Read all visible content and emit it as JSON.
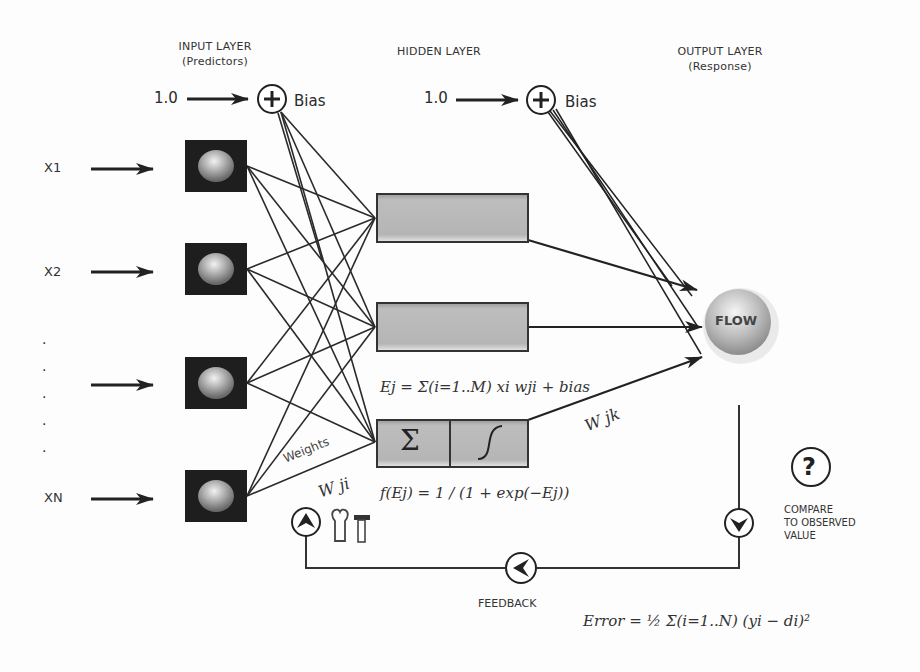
{
  "headers": {
    "input": {
      "title": "INPUT LAYER",
      "subtitle": "(Predictors)"
    },
    "hidden": {
      "title": "HIDDEN LAYER"
    },
    "output": {
      "title": "OUTPUT LAYER",
      "subtitle": "(Response)"
    }
  },
  "bias": [
    {
      "value": "1.0",
      "label": "Bias",
      "icon": "plus-circle-icon"
    },
    {
      "value": "1.0",
      "label": "Bias",
      "icon": "plus-circle-icon"
    }
  ],
  "inputs": [
    {
      "label": "X1"
    },
    {
      "label": "X2"
    },
    {
      "label": ""
    },
    {
      "label": "XN"
    }
  ],
  "ellipsis_dots": [
    "·",
    "·",
    "·",
    "·",
    "·"
  ],
  "hidden_nodes": [
    {
      "type": "neuron"
    },
    {
      "type": "neuron"
    },
    {
      "type": "neuron-detail",
      "sum_symbol": "Σ",
      "activation_icon": "sigmoid-curve-icon"
    }
  ],
  "output_node": {
    "label": "FLOW"
  },
  "weights": {
    "label": "Weights",
    "input_symbol": "W ji",
    "output_symbol": "W jk"
  },
  "equations": {
    "sum": "Ej = Σ(i=1..M) xi wji + bias",
    "activation": "f(Ej) = 1 / (1 + exp(−Ej))",
    "error": "Error = ½ Σ(i=1..N) (yi − di)²"
  },
  "compare": {
    "icon": "question-circle-icon",
    "lines": [
      "COMPARE",
      "TO OBSERVED",
      "VALUE"
    ]
  },
  "feedback": {
    "label": "FEEDBACK",
    "icons": [
      "arrow-left-circle-icon",
      "arrow-up-circle-icon",
      "arrow-down-circle-icon",
      "wrench-icon",
      "hammer-icon"
    ]
  }
}
